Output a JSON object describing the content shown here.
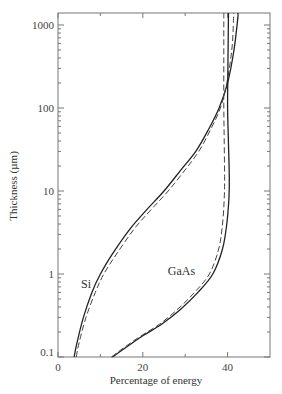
{
  "chart_data": {
    "type": "line",
    "title": "",
    "xlabel": "Percentage of energy",
    "ylabel": "Thickness (µm)",
    "xlim": [
      0,
      50
    ],
    "ylim": [
      0.1,
      2000
    ],
    "yscale": "log",
    "grid": false,
    "x_ticks": [
      0,
      20,
      40
    ],
    "x_tick_labels": [
      "0",
      "20",
      "40"
    ],
    "x_minor_ticks": [
      10,
      30
    ],
    "y_ticks": [
      0.1,
      1,
      10,
      100,
      1000
    ],
    "y_tick_labels": [
      "0.1",
      "1",
      "10",
      "100",
      "1000"
    ],
    "annotations": [
      {
        "text": "Si",
        "x": 8.5,
        "y": 0.75
      },
      {
        "text": "GaAs",
        "x": 31,
        "y": 1.1
      }
    ],
    "series": [
      {
        "name": "Si (solid)",
        "style": "solid",
        "x": [
          3.8,
          4.5,
          6.0,
          8.0,
          10.0,
          13.0,
          17.0,
          21.0,
          25.0,
          29.0,
          32.5,
          35.5,
          38.0,
          40.0,
          41.5,
          42.4,
          42.4
        ],
        "y": [
          0.1,
          0.15,
          0.3,
          0.6,
          1.0,
          1.8,
          3.5,
          6.0,
          10.0,
          18.0,
          30.0,
          55.0,
          100.0,
          200.0,
          500.0,
          1200.0,
          2000.0
        ]
      },
      {
        "name": "Si (dashed)",
        "style": "dashed",
        "x": [
          4.3,
          5.0,
          6.6,
          8.8,
          10.8,
          14.0,
          18.0,
          22.0,
          26.0,
          30.0,
          33.2,
          36.0,
          38.3,
          39.8,
          41.0,
          41.4,
          41.4
        ],
        "y": [
          0.1,
          0.15,
          0.3,
          0.6,
          1.0,
          1.8,
          3.5,
          6.0,
          10.0,
          18.0,
          30.0,
          55.0,
          100.0,
          200.0,
          500.0,
          1200.0,
          2000.0
        ]
      },
      {
        "name": "GaAs (solid)",
        "style": "solid",
        "x": [
          12.8,
          16.0,
          20.0,
          24.5,
          29.0,
          33.0,
          36.5,
          38.8,
          39.8,
          40.3,
          40.4,
          40.2,
          40.0,
          40.1,
          40.2,
          40.2
        ],
        "y": [
          0.1,
          0.13,
          0.18,
          0.25,
          0.38,
          0.6,
          1.0,
          2.0,
          4.0,
          8.0,
          15.0,
          40.0,
          100.0,
          400.0,
          1200.0,
          2000.0
        ]
      },
      {
        "name": "GaAs (dashed)",
        "style": "dashed",
        "x": [
          12.6,
          15.6,
          19.6,
          24.0,
          28.3,
          32.2,
          35.7,
          37.9,
          38.8,
          39.2,
          39.3,
          39.2,
          39.1,
          39.1,
          39.1,
          39.1
        ],
        "y": [
          0.1,
          0.13,
          0.18,
          0.25,
          0.38,
          0.6,
          1.0,
          2.0,
          4.0,
          8.0,
          15.0,
          40.0,
          100.0,
          400.0,
          1200.0,
          2000.0
        ]
      }
    ]
  }
}
